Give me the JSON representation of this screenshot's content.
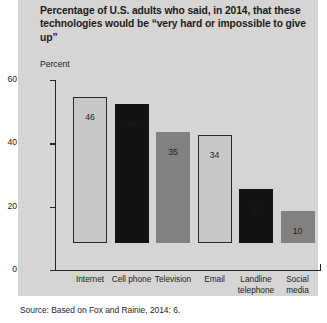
{
  "figure": {
    "title": "Percentage of U.S. adults who said, in 2014, that these technologies would be “very hard or impossible to give up”",
    "source": "Source: Based on Fox and Rainie, 2014: 6."
  },
  "chart_data": {
    "type": "bar",
    "title": "Percentage of U.S. adults who said, in 2014, that these technologies would be “very hard or impossible to give up”",
    "xlabel": "",
    "ylabel": "Percent",
    "ylim": [
      0,
      60
    ],
    "yticks": [
      0,
      20,
      40,
      60
    ],
    "ytick_labels": [
      "0",
      "20",
      "40",
      "60"
    ],
    "grid": false,
    "legend": false,
    "categories": [
      "Internet",
      "Cell phone",
      "Television",
      "Email",
      "Landline telephone",
      "Social media"
    ],
    "category_lines": [
      [
        "Internet"
      ],
      [
        "Cell phone"
      ],
      [
        "Television"
      ],
      [
        "Email"
      ],
      [
        "Landline",
        "telephone"
      ],
      [
        "Social",
        "media"
      ]
    ],
    "values": [
      46,
      44,
      35,
      34,
      17,
      10
    ],
    "value_labels": [
      "46",
      "44",
      "35",
      "34",
      "17",
      "10"
    ],
    "bar_styles": [
      "light",
      "dark",
      "mid",
      "light",
      "dark",
      "mid"
    ],
    "colors": {
      "light": "#c9c8c6",
      "dark": "#131313",
      "mid": "#828180",
      "panel_background": "#d6d5d3",
      "axis": "#262523",
      "text": "#22211f"
    }
  }
}
